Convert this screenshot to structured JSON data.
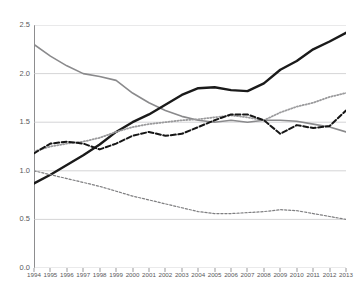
{
  "chart_data": {
    "type": "line",
    "title": "",
    "xlabel": "",
    "ylabel": "",
    "ylim": [
      0.0,
      2.5
    ],
    "ytick_labels": [
      "2.5",
      "2.0",
      "1.5",
      "1.0",
      "0.5",
      "0.0"
    ],
    "ytick_values": [
      2.5,
      2.0,
      1.5,
      1.0,
      0.5,
      0.0
    ],
    "grid": true,
    "legend": "none",
    "categories": [
      "1994",
      "1995",
      "1996",
      "1997",
      "1998",
      "1999",
      "2000",
      "2001",
      "2002",
      "2003",
      "2004",
      "2005",
      "2006",
      "2007",
      "2008",
      "2009",
      "2010",
      "2011",
      "2012",
      "2013"
    ],
    "series": [
      {
        "name": "gray-solid-declining",
        "style": "solid",
        "color": "#8a8a8c",
        "width": 1.6,
        "values": [
          2.3,
          2.18,
          2.08,
          2.0,
          1.97,
          1.93,
          1.8,
          1.7,
          1.62,
          1.56,
          1.52,
          1.5,
          1.52,
          1.5,
          1.52,
          1.52,
          1.51,
          1.48,
          1.45,
          1.4
        ]
      },
      {
        "name": "black-solid-rising",
        "style": "solid",
        "color": "#1a1a1a",
        "width": 2.4,
        "values": [
          0.87,
          0.96,
          1.06,
          1.16,
          1.27,
          1.4,
          1.5,
          1.58,
          1.68,
          1.78,
          1.85,
          1.86,
          1.83,
          1.82,
          1.9,
          2.04,
          2.13,
          2.25,
          2.33,
          2.42
        ]
      },
      {
        "name": "gray-dotted-rising",
        "style": "dotted",
        "color": "#9b9b9d",
        "width": 1.8,
        "values": [
          1.2,
          1.25,
          1.28,
          1.3,
          1.34,
          1.4,
          1.45,
          1.48,
          1.5,
          1.52,
          1.53,
          1.55,
          1.57,
          1.55,
          1.52,
          1.6,
          1.66,
          1.7,
          1.76,
          1.8
        ]
      },
      {
        "name": "black-dashed-wavy",
        "style": "dashed",
        "color": "#161616",
        "width": 2.0,
        "values": [
          1.18,
          1.28,
          1.3,
          1.28,
          1.22,
          1.28,
          1.36,
          1.4,
          1.36,
          1.38,
          1.45,
          1.52,
          1.58,
          1.58,
          1.52,
          1.38,
          1.47,
          1.44,
          1.46,
          1.62
        ]
      },
      {
        "name": "gray-fine-dashed-declining",
        "style": "fine-dashed",
        "color": "#7f7f81",
        "width": 1.2,
        "values": [
          1.0,
          0.96,
          0.92,
          0.88,
          0.84,
          0.79,
          0.74,
          0.7,
          0.66,
          0.62,
          0.58,
          0.56,
          0.56,
          0.57,
          0.58,
          0.6,
          0.59,
          0.56,
          0.53,
          0.5
        ]
      }
    ]
  },
  "axis": {
    "y_axis_name": "value-axis",
    "x_axis_name": "year-axis"
  }
}
